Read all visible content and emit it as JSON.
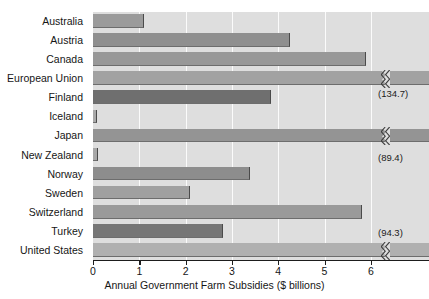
{
  "chart_data": {
    "type": "bar",
    "orientation": "horizontal",
    "title": "",
    "xlabel": "Annual Government Farm Subsidies ($ billions)",
    "ylabel": "",
    "xlim": [
      0,
      7.25
    ],
    "xticks": [
      0,
      1,
      2,
      3,
      4,
      5,
      6
    ],
    "xtick_labels": [
      "0",
      "1",
      "2",
      "3",
      "4",
      "5",
      "6"
    ],
    "grid": true,
    "grid_axis": "x",
    "legend": "none",
    "axis_break": true,
    "axis_break_note": "Bars for European Union, Japan and United States are broken; their true values are shown in parentheses.",
    "categories": [
      "Australia",
      "Austria",
      "Canada",
      "European Union",
      "Finland",
      "Iceland",
      "Japan",
      "New Zealand",
      "Norway",
      "Sweden",
      "Switzerland",
      "Turkey",
      "United States"
    ],
    "values": [
      1.1,
      4.25,
      5.9,
      134.7,
      3.85,
      0.08,
      89.4,
      0.1,
      3.4,
      2.1,
      5.8,
      2.8,
      94.3
    ],
    "bars": [
      {
        "label": "Australia",
        "value": 1.1,
        "plotted": 1.1,
        "broken": false,
        "annotation": "",
        "color": "#9b9b9b"
      },
      {
        "label": "Austria",
        "value": 4.25,
        "plotted": 4.25,
        "broken": false,
        "annotation": "",
        "color": "#8f8f8f"
      },
      {
        "label": "Canada",
        "value": 5.9,
        "plotted": 5.9,
        "broken": false,
        "annotation": "",
        "color": "#989898"
      },
      {
        "label": "European Union",
        "value": 134.7,
        "plotted": 7.25,
        "broken": true,
        "annotation": "(134.7)",
        "color": "#a2a2a2"
      },
      {
        "label": "Finland",
        "value": 3.85,
        "plotted": 3.85,
        "broken": false,
        "annotation": "",
        "color": "#6f6f6f"
      },
      {
        "label": "Iceland",
        "value": 0.08,
        "plotted": 0.08,
        "broken": false,
        "annotation": "",
        "color": "#a8a8a8"
      },
      {
        "label": "Japan",
        "value": 89.4,
        "plotted": 7.25,
        "broken": true,
        "annotation": "(89.4)",
        "color": "#949494"
      },
      {
        "label": "New Zealand",
        "value": 0.1,
        "plotted": 0.1,
        "broken": false,
        "annotation": "",
        "color": "#a8a8a8"
      },
      {
        "label": "Norway",
        "value": 3.4,
        "plotted": 3.4,
        "broken": false,
        "annotation": "",
        "color": "#8d8d8d"
      },
      {
        "label": "Sweden",
        "value": 2.1,
        "plotted": 2.1,
        "broken": false,
        "annotation": "",
        "color": "#a0a0a0"
      },
      {
        "label": "Switzerland",
        "value": 5.8,
        "plotted": 5.8,
        "broken": false,
        "annotation": "",
        "color": "#9a9a9a"
      },
      {
        "label": "Turkey",
        "value": 2.8,
        "plotted": 2.8,
        "broken": false,
        "annotation": "",
        "color": "#767676"
      },
      {
        "label": "United States",
        "value": 94.3,
        "plotted": 7.25,
        "broken": true,
        "annotation": "(94.3)",
        "color": "#b0b0b0"
      }
    ],
    "colors": {
      "plot_background": "#dedede",
      "gridline": "#fbfbfb",
      "axis": "#1d1d1d",
      "text": "#161616"
    }
  }
}
